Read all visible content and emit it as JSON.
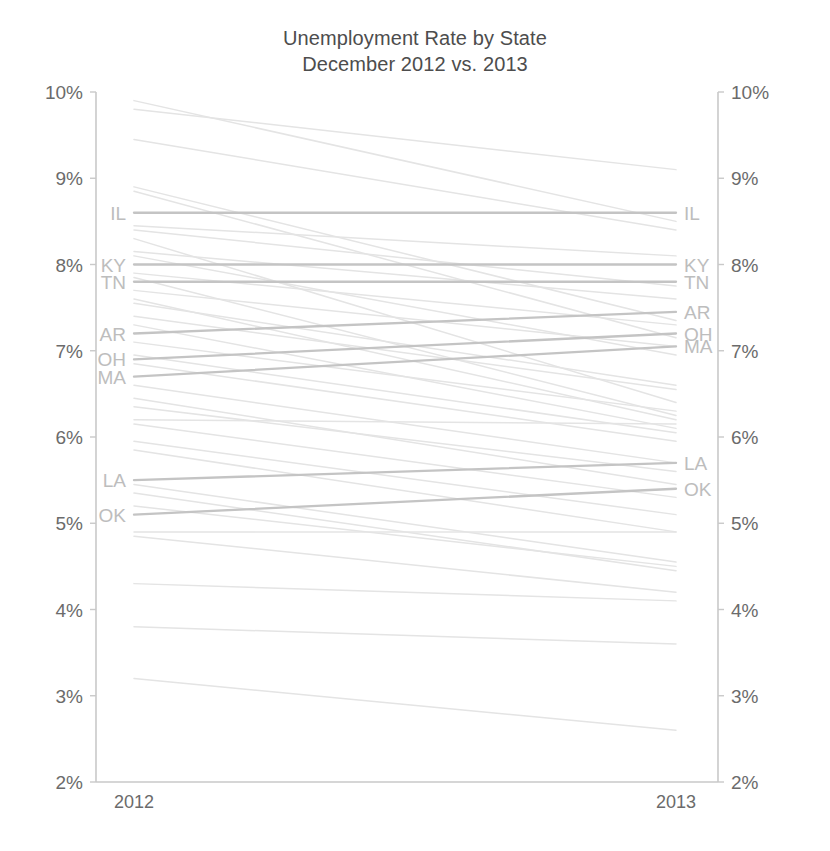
{
  "chart_data": {
    "type": "line",
    "title": "Unemployment Rate by State",
    "subtitle": "December 2012 vs. 2013",
    "xlabel": "",
    "ylabel": "",
    "categories": [
      "2012",
      "2013"
    ],
    "x": [
      "2012",
      "2013"
    ],
    "ylim": [
      2,
      10
    ],
    "y_tick_labels_left": [
      "10%",
      "9%",
      "8%",
      "7%",
      "6%",
      "5%",
      "4%",
      "3%",
      "2%"
    ],
    "y_tick_labels_right": [
      "10%",
      "9%",
      "8%",
      "7%",
      "6%",
      "5%",
      "4%",
      "3%",
      "2%"
    ],
    "y_ticks": [
      10,
      9,
      8,
      7,
      6,
      5,
      4,
      3,
      2
    ],
    "grid": false,
    "legend": "none",
    "value_suffix": "%",
    "highlight_color": "#c4c4c4",
    "faint_color": "#e4e4e4",
    "label_color": "#bdbdbd",
    "axis_color": "#c9c9c9",
    "text_color": "#6b6b6b",
    "highlighted_labels": [
      "IL",
      "KY",
      "TN",
      "AR",
      "OH",
      "MA",
      "LA",
      "OK"
    ],
    "series": [
      {
        "name": "IL",
        "label_left": "IL",
        "label_right": "IL",
        "highlight": true,
        "values": [
          8.6,
          8.6
        ]
      },
      {
        "name": "KY",
        "label_left": "KY",
        "label_right": "KY",
        "highlight": true,
        "values": [
          8.0,
          8.0
        ]
      },
      {
        "name": "TN",
        "label_left": "TN",
        "label_right": "TN",
        "highlight": true,
        "values": [
          7.8,
          7.8
        ]
      },
      {
        "name": "AR",
        "label_left": "AR",
        "label_right": "AR",
        "highlight": true,
        "values": [
          7.2,
          7.45
        ]
      },
      {
        "name": "OH",
        "label_left": "OH",
        "label_right": "OH",
        "highlight": true,
        "values": [
          6.9,
          7.2
        ]
      },
      {
        "name": "MA",
        "label_left": "MA",
        "label_right": "MA",
        "highlight": true,
        "values": [
          6.7,
          7.05
        ]
      },
      {
        "name": "LA",
        "label_left": "LA",
        "label_right": "LA",
        "highlight": true,
        "values": [
          5.5,
          5.7
        ]
      },
      {
        "name": "OK",
        "label_left": "OK",
        "label_right": "OK",
        "highlight": true,
        "values": [
          5.1,
          5.4
        ]
      },
      {
        "name": "s01",
        "label_left": "",
        "label_right": "",
        "highlight": false,
        "values": [
          9.9,
          8.5
        ]
      },
      {
        "name": "s02",
        "label_left": "",
        "label_right": "",
        "highlight": false,
        "values": [
          9.8,
          9.1
        ]
      },
      {
        "name": "s03",
        "label_left": "",
        "label_right": "",
        "highlight": false,
        "values": [
          9.45,
          8.4
        ]
      },
      {
        "name": "s04",
        "label_left": "",
        "label_right": "",
        "highlight": false,
        "values": [
          8.9,
          7.35
        ]
      },
      {
        "name": "s05",
        "label_left": "",
        "label_right": "",
        "highlight": false,
        "values": [
          8.85,
          7.15
        ]
      },
      {
        "name": "s06",
        "label_left": "",
        "label_right": "",
        "highlight": false,
        "values": [
          8.45,
          8.1
        ]
      },
      {
        "name": "s07",
        "label_left": "",
        "label_right": "",
        "highlight": false,
        "values": [
          8.4,
          7.75
        ]
      },
      {
        "name": "s08",
        "label_left": "",
        "label_right": "",
        "highlight": false,
        "values": [
          8.3,
          6.4
        ]
      },
      {
        "name": "s09",
        "label_left": "",
        "label_right": "",
        "highlight": false,
        "values": [
          8.15,
          7.6
        ]
      },
      {
        "name": "s10",
        "label_left": "",
        "label_right": "",
        "highlight": false,
        "values": [
          8.1,
          6.95
        ]
      },
      {
        "name": "s11",
        "label_left": "",
        "label_right": "",
        "highlight": false,
        "values": [
          7.9,
          7.3
        ]
      },
      {
        "name": "s12",
        "label_left": "",
        "label_right": "",
        "highlight": false,
        "values": [
          7.85,
          6.25
        ]
      },
      {
        "name": "s13",
        "label_left": "",
        "label_right": "",
        "highlight": false,
        "values": [
          7.7,
          7.05
        ]
      },
      {
        "name": "s14",
        "label_left": "",
        "label_right": "",
        "highlight": false,
        "values": [
          7.6,
          6.2
        ]
      },
      {
        "name": "s15",
        "label_left": "",
        "label_right": "",
        "highlight": false,
        "values": [
          7.55,
          6.6
        ]
      },
      {
        "name": "s16",
        "label_left": "",
        "label_right": "",
        "highlight": false,
        "values": [
          7.4,
          6.55
        ]
      },
      {
        "name": "s17",
        "label_left": "",
        "label_right": "",
        "highlight": false,
        "values": [
          7.3,
          6.1
        ]
      },
      {
        "name": "s18",
        "label_left": "",
        "label_right": "",
        "highlight": false,
        "values": [
          7.1,
          6.3
        ]
      },
      {
        "name": "s19",
        "label_left": "",
        "label_right": "",
        "highlight": false,
        "values": [
          6.95,
          6.05
        ]
      },
      {
        "name": "s20",
        "label_left": "",
        "label_right": "",
        "highlight": false,
        "values": [
          6.85,
          5.95
        ]
      },
      {
        "name": "s21",
        "label_left": "",
        "label_right": "",
        "highlight": false,
        "values": [
          6.6,
          5.7
        ]
      },
      {
        "name": "s22",
        "label_left": "",
        "label_right": "",
        "highlight": false,
        "values": [
          6.45,
          5.45
        ]
      },
      {
        "name": "s23",
        "label_left": "",
        "label_right": "",
        "highlight": false,
        "values": [
          6.35,
          5.6
        ]
      },
      {
        "name": "s24",
        "label_left": "",
        "label_right": "",
        "highlight": false,
        "values": [
          6.2,
          6.15
        ]
      },
      {
        "name": "s25",
        "label_left": "",
        "label_right": "",
        "highlight": false,
        "values": [
          6.15,
          5.3
        ]
      },
      {
        "name": "s26",
        "label_left": "",
        "label_right": "",
        "highlight": false,
        "values": [
          5.95,
          5.1
        ]
      },
      {
        "name": "s27",
        "label_left": "",
        "label_right": "",
        "highlight": false,
        "values": [
          5.85,
          4.9
        ]
      },
      {
        "name": "s28",
        "label_left": "",
        "label_right": "",
        "highlight": false,
        "values": [
          5.45,
          4.55
        ]
      },
      {
        "name": "s29",
        "label_left": "",
        "label_right": "",
        "highlight": false,
        "values": [
          5.35,
          4.45
        ]
      },
      {
        "name": "s30",
        "label_left": "",
        "label_right": "",
        "highlight": false,
        "values": [
          5.2,
          4.5
        ]
      },
      {
        "name": "s31",
        "label_left": "",
        "label_right": "",
        "highlight": false,
        "values": [
          4.9,
          4.9
        ]
      },
      {
        "name": "s32",
        "label_left": "",
        "label_right": "",
        "highlight": false,
        "values": [
          4.85,
          4.2
        ]
      },
      {
        "name": "s33",
        "label_left": "",
        "label_right": "",
        "highlight": false,
        "values": [
          4.3,
          4.1
        ]
      },
      {
        "name": "s34",
        "label_left": "",
        "label_right": "",
        "highlight": false,
        "values": [
          3.8,
          3.6
        ]
      },
      {
        "name": "s35",
        "label_left": "",
        "label_right": "",
        "highlight": false,
        "values": [
          3.2,
          2.6
        ]
      }
    ]
  }
}
